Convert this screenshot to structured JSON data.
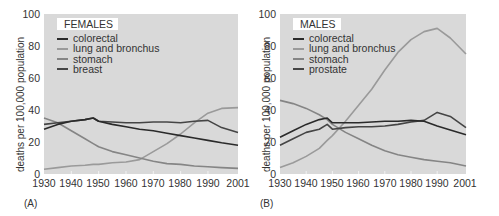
{
  "panels": [
    {
      "tag": "(A)",
      "legend_title": "FEMALES",
      "ylabel": "deaths per 100,000 population",
      "legend": [
        {
          "label": "colorectal",
          "color": "#2a2a2a"
        },
        {
          "label": "lung and bronchus",
          "color": "#9a9a9a"
        },
        {
          "label": "stomach",
          "color": "#858585"
        },
        {
          "label": "breast",
          "color": "#454545"
        }
      ]
    },
    {
      "tag": "(B)",
      "legend_title": "MALES",
      "ylabel": "deaths per 100,000 population",
      "legend": [
        {
          "label": "colorectal",
          "color": "#2a2a2a"
        },
        {
          "label": "lung and bronchus",
          "color": "#9a9a9a"
        },
        {
          "label": "stomach",
          "color": "#858585"
        },
        {
          "label": "prostate",
          "color": "#454545"
        }
      ]
    }
  ],
  "axes": {
    "yticks": [
      "100",
      "80",
      "60",
      "40",
      "20",
      "0"
    ],
    "xticks": [
      "1930",
      "1940",
      "1950",
      "1960",
      "1970",
      "1980",
      "1990",
      "2001"
    ]
  },
  "chart_data": [
    {
      "type": "line",
      "title": "FEMALES",
      "panel_label": "(A)",
      "xlabel": "",
      "ylabel": "deaths per 100,000 population",
      "xlim": [
        1930,
        2001
      ],
      "ylim": [
        0,
        100
      ],
      "grid": false,
      "legend_position": "upper left",
      "x": [
        1930,
        1935,
        1940,
        1945,
        1948,
        1950,
        1955,
        1960,
        1965,
        1970,
        1975,
        1980,
        1985,
        1990,
        1995,
        2001
      ],
      "series": [
        {
          "name": "colorectal",
          "color": "#2a2a2a",
          "values": [
            28,
            31,
            33,
            34,
            35,
            33,
            31,
            29.5,
            28,
            27,
            25.5,
            24,
            22.5,
            21,
            19.5,
            18
          ]
        },
        {
          "name": "lung and bronchus",
          "color": "#9a9a9a",
          "values": [
            3,
            4,
            5,
            5.5,
            6,
            6,
            7,
            7.5,
            9,
            14,
            19,
            25,
            32,
            38,
            41,
            41.5
          ]
        },
        {
          "name": "stomach",
          "color": "#858585",
          "values": [
            35,
            32,
            27,
            22,
            19,
            17,
            14,
            12,
            10,
            8,
            6.5,
            6,
            5,
            4.5,
            4,
            3.5
          ]
        },
        {
          "name": "breast",
          "color": "#454545",
          "values": [
            31,
            32,
            33,
            34,
            35,
            33,
            32.5,
            32,
            32,
            32.5,
            32.5,
            32,
            33,
            33.5,
            29,
            26
          ]
        }
      ]
    },
    {
      "type": "line",
      "title": "MALES",
      "panel_label": "(B)",
      "xlabel": "",
      "ylabel": "deaths per 100,000 population",
      "xlim": [
        1930,
        2001
      ],
      "ylim": [
        0,
        100
      ],
      "grid": false,
      "legend_position": "upper left",
      "x": [
        1930,
        1935,
        1940,
        1945,
        1948,
        1950,
        1955,
        1960,
        1965,
        1970,
        1975,
        1980,
        1985,
        1990,
        1995,
        2001
      ],
      "series": [
        {
          "name": "colorectal",
          "color": "#2a2a2a",
          "values": [
            23,
            27,
            31,
            34,
            35,
            32,
            32,
            32,
            32.5,
            33,
            33,
            33.5,
            33,
            30,
            27.5,
            24.5
          ]
        },
        {
          "name": "lung and bronchus",
          "color": "#9a9a9a",
          "values": [
            4,
            7,
            11,
            16,
            21,
            24,
            33,
            43,
            53,
            65,
            76,
            84,
            89,
            91,
            85,
            75
          ]
        },
        {
          "name": "stomach",
          "color": "#858585",
          "values": [
            46,
            44,
            41,
            37,
            34,
            31,
            26,
            22,
            18,
            14.5,
            12,
            10.5,
            9,
            8,
            7,
            5
          ]
        },
        {
          "name": "prostate",
          "color": "#454545",
          "values": [
            18,
            22,
            26,
            28,
            31,
            28,
            29,
            29.5,
            29.5,
            30,
            31,
            32.5,
            33.5,
            38.5,
            36,
            29
          ]
        }
      ]
    }
  ]
}
